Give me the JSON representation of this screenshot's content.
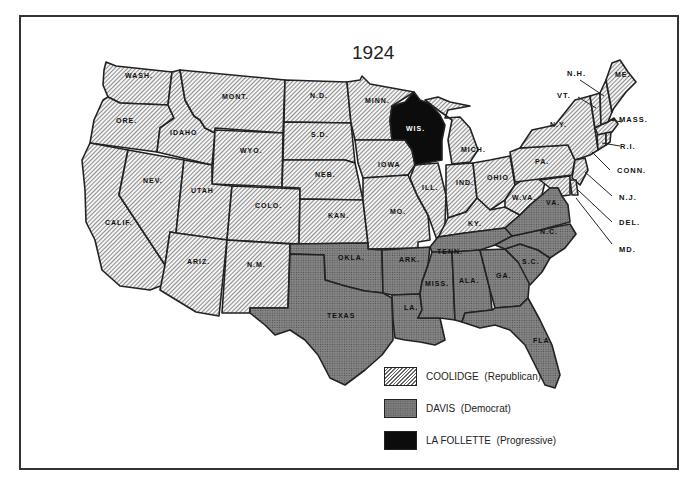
{
  "title": "1924",
  "colors": {
    "republican_fill": "hatched-gray",
    "democrat_fill": "#7a7a7a",
    "progressive_fill": "#0c0c0c",
    "border": "#222222"
  },
  "legend": [
    {
      "swatch": "hatched",
      "candidate": "COOLIDGE",
      "party": "(Republican)"
    },
    {
      "swatch": "stippled",
      "candidate": "DAVIS",
      "party": "(Democrat)"
    },
    {
      "swatch": "black",
      "candidate": "LA FOLLETTE",
      "party": "(Progressive)"
    }
  ],
  "states": {
    "republican": [
      "WASH.",
      "ORE.",
      "CALIF.",
      "IDAHO",
      "NEV.",
      "MONT.",
      "WYO.",
      "UTAH",
      "ARIZ.",
      "COLO.",
      "N.M.",
      "N.D.",
      "S.D.",
      "NEB.",
      "KAN.",
      "MINN.",
      "IOWA",
      "MO.",
      "ILL.",
      "MICH.",
      "IND.",
      "OHIO",
      "KY.",
      "W.VA.",
      "PA.",
      "N.Y.",
      "VT.",
      "N.H.",
      "ME.",
      "MASS.",
      "R.I.",
      "CONN.",
      "N.J.",
      "DEL.",
      "MD."
    ],
    "democrat": [
      "OKLA.",
      "TEXAS",
      "ARK.",
      "LA.",
      "TENN.",
      "MISS.",
      "ALA.",
      "GA.",
      "FLA.",
      "S.C.",
      "N.C.",
      "VA."
    ],
    "progressive": [
      "WIS."
    ]
  },
  "labels": {
    "wash": "WASH.",
    "ore": "ORE.",
    "calif": "CALIF.",
    "idaho": "IDAHO",
    "nev": "NEV.",
    "mont": "MONT.",
    "wyo": "WYO.",
    "utah": "UTAH",
    "ariz": "ARIZ.",
    "colo": "COLO.",
    "nm": "N.M.",
    "nd": "N.D.",
    "sd": "S.D.",
    "neb": "NEB.",
    "kan": "KAN.",
    "minn": "MINN.",
    "iowa": "IOWA",
    "mo": "MO.",
    "wis": "WIS.",
    "ill": "ILL.",
    "mich": "MICH.",
    "ind": "IND.",
    "ohio": "OHIO",
    "ky": "KY.",
    "wva": "W.VA.",
    "pa": "PA.",
    "ny": "N.Y.",
    "vt": "VT.",
    "nh": "N.H.",
    "me": "ME.",
    "mass": "MASS.",
    "ri": "R.I.",
    "conn": "CONN.",
    "nj": "N.J.",
    "del": "DEL.",
    "md": "MD.",
    "okla": "OKLA.",
    "texas": "TEXAS",
    "ark": "ARK.",
    "la": "LA.",
    "tenn": "TENN.",
    "miss": "MISS.",
    "ala": "ALA.",
    "ga": "GA.",
    "fla": "FLA.",
    "sc": "S.C.",
    "nc": "N.C.",
    "va": "VA."
  }
}
